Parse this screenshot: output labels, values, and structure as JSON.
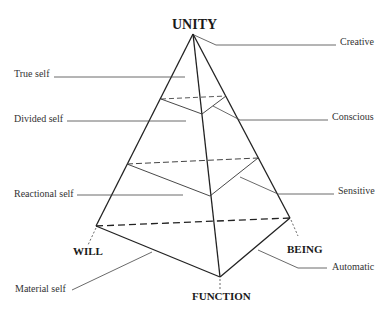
{
  "diagram": {
    "vertices": {
      "top": "UNITY",
      "left": "WILL",
      "right": "BEING",
      "bottom": "FUNCTION"
    },
    "left_labels": [
      "True self",
      "Divided self",
      "Reactional self",
      "Material self"
    ],
    "right_labels": [
      "Creative",
      "Conscious",
      "Sensitive",
      "Automatic"
    ]
  }
}
